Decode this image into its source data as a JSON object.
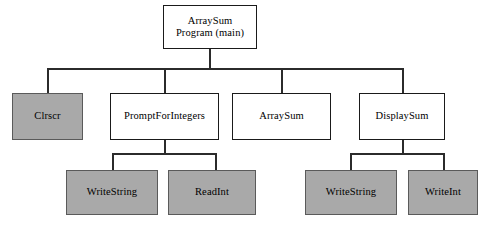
{
  "diagram": {
    "type": "structure-chart",
    "background_color": "#ffffff",
    "line_color": "#1a1a1a",
    "box_fill_white": "#ffffff",
    "box_fill_gray": "#a9a9a9",
    "levels": 3,
    "nodes": [
      {
        "id": "main",
        "label": "ArraySum\nProgram (main)",
        "level": 0,
        "fill": "white",
        "x": 163,
        "y": 5,
        "w": 94,
        "h": 44
      },
      {
        "id": "clrscr",
        "label": "Clrscr",
        "level": 1,
        "fill": "gray",
        "x": 12,
        "y": 93,
        "w": 71,
        "h": 47
      },
      {
        "id": "promptforintegers",
        "label": "PromptForIntegers",
        "level": 1,
        "fill": "white",
        "x": 110,
        "y": 93,
        "w": 109,
        "h": 47
      },
      {
        "id": "arraysum",
        "label": "ArraySum",
        "level": 1,
        "fill": "white",
        "x": 232,
        "y": 93,
        "w": 99,
        "h": 47
      },
      {
        "id": "displaysum",
        "label": "DisplaySum",
        "level": 1,
        "fill": "white",
        "x": 359,
        "y": 93,
        "w": 86,
        "h": 47
      },
      {
        "id": "writestring-prompt",
        "label": "WriteString",
        "level": 2,
        "fill": "gray",
        "x": 66,
        "y": 170,
        "w": 92,
        "h": 45
      },
      {
        "id": "readint",
        "label": "ReadInt",
        "level": 2,
        "fill": "gray",
        "x": 168,
        "y": 170,
        "w": 88,
        "h": 45
      },
      {
        "id": "writestring-display",
        "label": "WriteString",
        "level": 2,
        "fill": "gray",
        "x": 305,
        "y": 170,
        "w": 92,
        "h": 45
      },
      {
        "id": "writeint",
        "label": "WriteInt",
        "level": 2,
        "fill": "gray",
        "x": 408,
        "y": 170,
        "w": 70,
        "h": 45
      }
    ],
    "edges": [
      {
        "from": "main",
        "to": "clrscr"
      },
      {
        "from": "main",
        "to": "promptforintegers"
      },
      {
        "from": "main",
        "to": "arraysum"
      },
      {
        "from": "main",
        "to": "displaysum"
      },
      {
        "from": "promptforintegers",
        "to": "writestring-prompt"
      },
      {
        "from": "promptforintegers",
        "to": "readint"
      },
      {
        "from": "displaysum",
        "to": "writestring-display"
      },
      {
        "from": "displaysum",
        "to": "writeint"
      }
    ]
  }
}
